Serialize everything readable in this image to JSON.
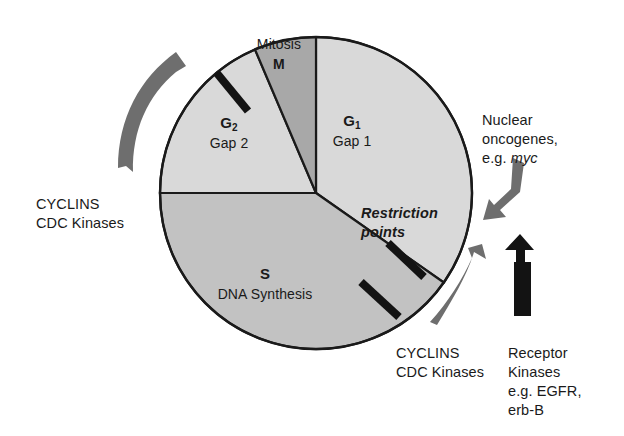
{
  "figure": {
    "kind": "cell-cycle-diagram",
    "background": "#ffffff",
    "circle": {
      "center_x": 316,
      "center_y": 193,
      "radius": 156,
      "outline_color": "#1a1a1a"
    },
    "colors": {
      "g1_fill": "#d9d9d9",
      "g2_fill": "#d9d9d9",
      "s_fill": "#c2c2c2",
      "m_fill": "#a8a8a8",
      "outline": "#1a1a1a",
      "gray_arrow": "#6e6e6e",
      "black_arrow": "#131313",
      "restriction_bar": "#131313",
      "text": "#1a1a1a"
    }
  },
  "sectors": [
    {
      "id": "g1",
      "code": "G",
      "code_subscript": "1",
      "name": "Gap 1",
      "start_angle_deg": -90,
      "end_angle_deg": 35,
      "fill": "#d9d9d9",
      "label_x": 352,
      "label_y": 122
    },
    {
      "id": "s",
      "code": "S",
      "code_subscript": "",
      "name": "DNA Synthesis",
      "start_angle_deg": 35,
      "end_angle_deg": 180,
      "fill": "#c2c2c2",
      "label_x": 265,
      "label_y": 265
    },
    {
      "id": "g2",
      "code": "G",
      "code_subscript": "2",
      "name": "Gap 2",
      "start_angle_deg": 180,
      "end_angle_deg": -113,
      "fill": "#d9d9d9",
      "label_x": 229,
      "label_y": 124
    },
    {
      "id": "m",
      "code": "M",
      "code_subscript": "",
      "name": "Mitosis",
      "start_angle_deg": -113,
      "end_angle_deg": -90,
      "fill": "#a8a8a8",
      "label_x": 280,
      "label_y": 45
    }
  ],
  "restriction_points": {
    "label_line1": "Restriction",
    "label_line2": "points",
    "label_x": 391,
    "label_y": 205,
    "bars": [
      {
        "id": "bar-g2",
        "x1": 210,
        "y1": 66,
        "x2": 247,
        "y2": 110
      },
      {
        "id": "bar-upper",
        "x1": 389,
        "y1": 244,
        "x2": 424,
        "y2": 276
      },
      {
        "id": "bar-lower",
        "x1": 362,
        "y1": 283,
        "x2": 398,
        "y2": 316
      }
    ]
  },
  "annotations": [
    {
      "id": "cyclins-left",
      "lines": [
        "CYCLINS",
        "CDC Kinases"
      ],
      "x": 36,
      "y": 196,
      "align": "left"
    },
    {
      "id": "cyclins-bottom",
      "lines": [
        "CYCLINS",
        "CDC Kinases"
      ],
      "x": 396,
      "y": 345,
      "align": "left"
    },
    {
      "id": "nuclear-oncogenes",
      "lines": [
        "Nuclear",
        "oncogenes,",
        "e.g. myc"
      ],
      "italic_word": "myc",
      "x": 482,
      "y": 112,
      "align": "left"
    },
    {
      "id": "receptor-kinases",
      "lines": [
        "Receptor",
        "Kinases",
        "e.g. EGFR,",
        "erb-B"
      ],
      "x": 508,
      "y": 345,
      "align": "left"
    }
  ],
  "arrows": [
    {
      "id": "cyclins-left-arrow",
      "style": "curved-ribbon",
      "color": "#6e6e6e",
      "direction": "counterclockwise-up",
      "points_to": "g2-sector"
    },
    {
      "id": "cyclins-bottom-arrow",
      "style": "curved-ribbon",
      "color": "#6e6e6e",
      "direction": "up-right",
      "points_to": "s-g1-boundary"
    },
    {
      "id": "nuclear-oncogenes-arrow",
      "style": "bent-arrow",
      "color": "#6e6e6e",
      "direction": "down-left",
      "points_to": "g1-sector"
    },
    {
      "id": "receptor-kinases-arrow",
      "style": "bent-arrow",
      "color": "#131313",
      "direction": "up-left",
      "points_to": "cyclins-bottom-arrow"
    }
  ]
}
